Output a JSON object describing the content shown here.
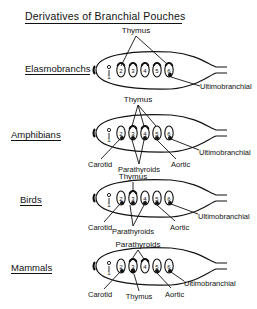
{
  "title": "Derivatives of Branchial Pouches",
  "groups": [
    {
      "name": "Elasmobranchs",
      "pouches": [
        "1",
        "2",
        "3",
        "4",
        "5",
        "6"
      ],
      "labels": [
        "Thymus",
        "Ultimobranchial"
      ]
    },
    {
      "name": "Amphibians",
      "pouches": [
        "1",
        "2",
        "3",
        "4",
        "5",
        "6"
      ],
      "labels": [
        "Thymus",
        "Carotid",
        "Parathyroids",
        "Aortic",
        "Ultimobranchial"
      ]
    },
    {
      "name": "Birds",
      "pouches": [
        "1",
        "2",
        "3",
        "4",
        "5",
        "6"
      ],
      "labels": [
        "Thymus",
        "Carotid",
        "Parathyroids",
        "Aortic",
        "Ultimobranchial"
      ]
    },
    {
      "name": "Mammals",
      "pouches": [
        "1",
        "2",
        "3",
        "4",
        "5",
        "6"
      ],
      "labels": [
        "Parathyroids",
        "Carotid",
        "Thymus",
        "Aortic",
        "Ultimobranchial"
      ]
    }
  ]
}
